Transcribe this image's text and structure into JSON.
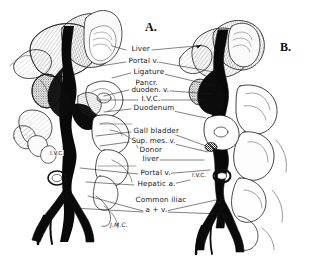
{
  "figure": {
    "background_color": "#ffffff",
    "ink_color": "#111111",
    "width": 309,
    "height": 257
  },
  "panels": [
    {
      "id": "A",
      "label": "A.",
      "x": 145,
      "y": 20
    },
    {
      "id": "B",
      "label": "B.",
      "x": 280,
      "y": 40
    }
  ],
  "labels": [
    {
      "id": "liver",
      "text": "Liver",
      "x": 131,
      "y": 45
    },
    {
      "id": "portal-v-upper",
      "text": "Portal v.",
      "x": 128,
      "y": 57
    },
    {
      "id": "ligature",
      "text": "Ligature",
      "x": 133,
      "y": 68
    },
    {
      "id": "pancr",
      "text": "Pancr.",
      "x": 135,
      "y": 80
    },
    {
      "id": "duoden-v",
      "text": "duoden. v.",
      "x": 131,
      "y": 87
    },
    {
      "id": "ivc",
      "text": "I.V.C.",
      "x": 141,
      "y": 96
    },
    {
      "id": "duodenum",
      "text": "Duodenum",
      "x": 133,
      "y": 105
    },
    {
      "id": "gall-bladder",
      "text": "Gall bladder",
      "x": 133,
      "y": 128
    },
    {
      "id": "sup-mes-v",
      "text": "Sup. mes. v.",
      "x": 131,
      "y": 138
    },
    {
      "id": "donor",
      "text": "Donor",
      "x": 139,
      "y": 147
    },
    {
      "id": "donor-liver",
      "text": "liver",
      "x": 142,
      "y": 156
    },
    {
      "id": "portal-v-lower",
      "text": "Portal v.",
      "x": 140,
      "y": 170
    },
    {
      "id": "hepatic-a",
      "text": "Hepatic a.",
      "x": 137,
      "y": 181
    },
    {
      "id": "common-iliac",
      "text": "Common iliac",
      "x": 135,
      "y": 198
    },
    {
      "id": "a-plus-v",
      "text": "a + v.",
      "x": 145,
      "y": 208
    }
  ],
  "inline_labels": [
    {
      "id": "ivc-left-specimen",
      "text": "I.V.C.",
      "x": 50,
      "y": 150
    },
    {
      "id": "ivc-right-specimen",
      "text": "I.V.C.",
      "x": 192,
      "y": 172
    }
  ],
  "signature": {
    "text": "J.M.C.",
    "x": 110,
    "y": 221
  }
}
